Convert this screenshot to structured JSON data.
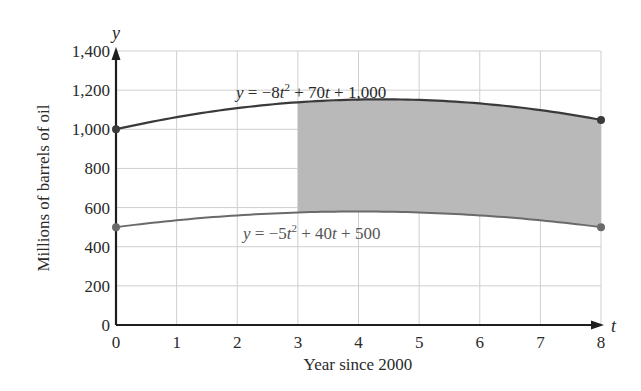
{
  "chart_data": {
    "type": "area",
    "title": "",
    "xlabel": "Year since 2000",
    "ylabel": "Millions of barrels of oil",
    "x_axis_var": "t",
    "y_axis_var": "y",
    "xlim": [
      0,
      8
    ],
    "ylim": [
      0,
      1400
    ],
    "x_ticks": [
      "0",
      "1",
      "2",
      "3",
      "4",
      "5",
      "6",
      "7",
      "8"
    ],
    "y_ticks": [
      "0",
      "200",
      "400",
      "600",
      "800",
      "1,000",
      "1,200",
      "1,400"
    ],
    "grid": true,
    "series": [
      {
        "name": "y = −8t² + 70t + 1,000",
        "formula": {
          "a": -8,
          "b": 70,
          "c": 1000
        },
        "x": [
          0,
          1,
          2,
          3,
          4,
          5,
          6,
          7,
          8
        ],
        "values": [
          1000,
          1062,
          1108,
          1138,
          1152,
          1150,
          1132,
          1098,
          1048
        ],
        "endpoints": [
          [
            0,
            1000
          ],
          [
            8,
            1048
          ]
        ],
        "color": "#3a3a3a"
      },
      {
        "name": "y = −5t² + 40t + 500",
        "formula": {
          "a": -5,
          "b": 40,
          "c": 500
        },
        "x": [
          0,
          1,
          2,
          3,
          4,
          5,
          6,
          7,
          8
        ],
        "values": [
          500,
          535,
          560,
          575,
          580,
          575,
          560,
          535,
          500
        ],
        "endpoints": [
          [
            0,
            500
          ],
          [
            8,
            500
          ]
        ],
        "color": "#6a6a6a"
      }
    ],
    "shaded_region": {
      "between": [
        "y = −8t² + 70t + 1,000",
        "y = −5t² + 40t + 500"
      ],
      "t_from": 3,
      "t_to": 8,
      "color": "#b9b9b9"
    },
    "annotations": [
      {
        "text_parts": [
          "y",
          " = −8",
          "t",
          "2",
          " + 70",
          "t",
          " + 1,000"
        ],
        "position": "above upper curve"
      },
      {
        "text_parts": [
          "y",
          " = −5",
          "t",
          "2",
          " + 40",
          "t",
          " + 500"
        ],
        "position": "below lower curve"
      }
    ]
  },
  "labels": {
    "xlabel": "Year since 2000",
    "ylabel": "Millions of barrels of oil",
    "x_var": "t",
    "y_var": "y",
    "eq_upper": {
      "y": "y",
      "p1": " = −8",
      "t1": "t",
      "sup": "2",
      "p2": " + 70",
      "t2": "t",
      "p3": " + 1,000"
    },
    "eq_lower": {
      "y": "y",
      "p1": " = −5",
      "t1": "t",
      "sup": "2",
      "p2": " + 40",
      "t2": "t",
      "p3": " + 500"
    }
  }
}
